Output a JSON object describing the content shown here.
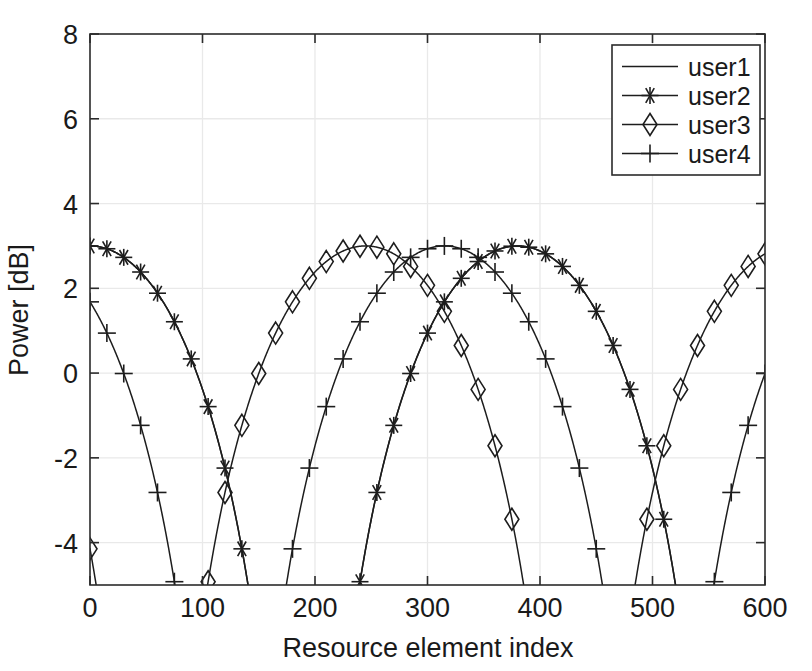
{
  "chart_data": {
    "type": "line",
    "title": "",
    "xlabel": "Resource element index",
    "ylabel": "Power [dB]",
    "xlim": [
      0,
      600
    ],
    "ylim": [
      -5,
      8
    ],
    "xticks": [
      0,
      100,
      200,
      300,
      400,
      500,
      600
    ],
    "yticks": [
      -4,
      -2,
      0,
      2,
      4,
      6,
      8
    ],
    "xtick_labels": [
      "0",
      "100",
      "200",
      "300",
      "400",
      "500",
      "600"
    ],
    "ytick_labels": [
      "-4",
      "-2",
      "0",
      "2",
      "4",
      "6",
      "8"
    ],
    "grid": true,
    "legend_position": "upper right",
    "peak_power_db": 3,
    "marker_step": 15,
    "series": [
      {
        "name": "user1",
        "marker": "none",
        "center": 0,
        "period": 380,
        "nulls": [
          62,
          192,
          324,
          580
        ],
        "peaks": [
          0,
          253,
          507
        ],
        "x": [
          0,
          25,
          50,
          62,
          75,
          100,
          125,
          150,
          175,
          192,
          200,
          225,
          250,
          253,
          275,
          300,
          324,
          350,
          375,
          400,
          425,
          450,
          475,
          500,
          507,
          525,
          550,
          575,
          580,
          600
        ],
        "y": [
          3.0,
          2.4,
          0.8,
          -5.0,
          0.4,
          2.0,
          2.6,
          2.9,
          2.2,
          -5.0,
          1.2,
          2.7,
          3.0,
          3.0,
          2.5,
          1.1,
          -5.0,
          1.3,
          2.5,
          2.9,
          2.98,
          2.95,
          2.9,
          2.99,
          3.0,
          2.9,
          2.4,
          0.9,
          -5.0,
          1.7
        ]
      },
      {
        "name": "user2",
        "marker": "asterisk",
        "center": 380,
        "period": 380,
        "nulls": [
          62,
          192,
          578
        ],
        "peaks": [
          385
        ],
        "x": [
          0,
          15,
          30,
          45,
          60,
          62,
          75,
          90,
          105,
          120,
          135,
          150,
          165,
          180,
          192,
          195,
          210,
          225,
          240,
          255,
          270,
          285,
          300,
          315,
          330,
          345,
          360,
          375,
          385,
          390,
          405,
          420,
          435,
          450,
          465,
          480,
          495,
          510,
          525,
          540,
          555,
          570,
          578,
          585,
          600
        ],
        "y": [
          0.0,
          -0.8,
          -2.7,
          -3.9,
          -5.0,
          -5.3,
          -4.9,
          -3.5,
          -2.35,
          -1.4,
          -0.55,
          0.2,
          0.85,
          1.3,
          -5.0,
          -5.2,
          -3.6,
          -2.3,
          -1.35,
          -0.5,
          0.25,
          0.9,
          1.5,
          2.05,
          2.4,
          2.7,
          2.88,
          2.97,
          3.0,
          2.97,
          2.88,
          2.7,
          2.4,
          2.05,
          1.5,
          0.9,
          0.25,
          -0.5,
          -1.35,
          -2.3,
          -3.6,
          -5.0,
          -5.3,
          -5.0,
          -3.0
        ]
      },
      {
        "name": "user3",
        "marker": "diamond",
        "center": 245,
        "period": 380,
        "nulls": [
          80,
          440,
          576
        ],
        "peaks": [
          245
        ]
      },
      {
        "name": "user4",
        "marker": "plus",
        "center": 315,
        "period": 380,
        "nulls": [
          133,
          512
        ],
        "peaks": [
          315
        ]
      }
    ],
    "legend_entries": [
      {
        "label": "user1",
        "marker": "none"
      },
      {
        "label": "user2",
        "marker": "asterisk"
      },
      {
        "label": "user3",
        "marker": "diamond"
      },
      {
        "label": "user4",
        "marker": "plus"
      }
    ]
  },
  "axes": {
    "x_title": "Resource element index",
    "y_title": "Power [dB]"
  },
  "colors": {
    "line": "#1d1d1d",
    "axis": "#2b2b2b",
    "grid": "#e9e9e9",
    "background": "#ffffff"
  }
}
